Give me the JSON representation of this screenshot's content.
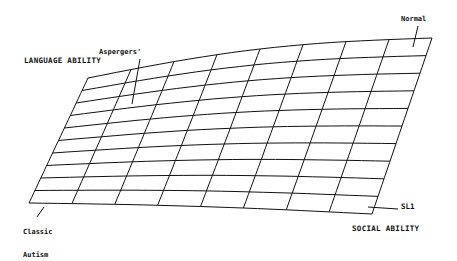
{
  "diagram": {
    "title": "",
    "axes": {
      "vertical_label": "LANGUAGE ABILITY",
      "horizontal_label": "SOCIAL ABILITY"
    },
    "surface_label": "SL1",
    "annotations": {
      "aspergers": "Aspergers'",
      "normal": "Normal",
      "classic_autism_line1": "Classic",
      "classic_autism_line2": "Autism"
    },
    "grid": {
      "rows": 10,
      "columns": 8,
      "corners": {
        "top_left": [
          88,
          78
        ],
        "top_right": [
          432,
          38
        ],
        "bottom_left": [
          29,
          203
        ],
        "bottom_right": [
          372,
          214
        ]
      }
    },
    "colors": {
      "line": "#111111",
      "background": "#ffffff"
    }
  }
}
